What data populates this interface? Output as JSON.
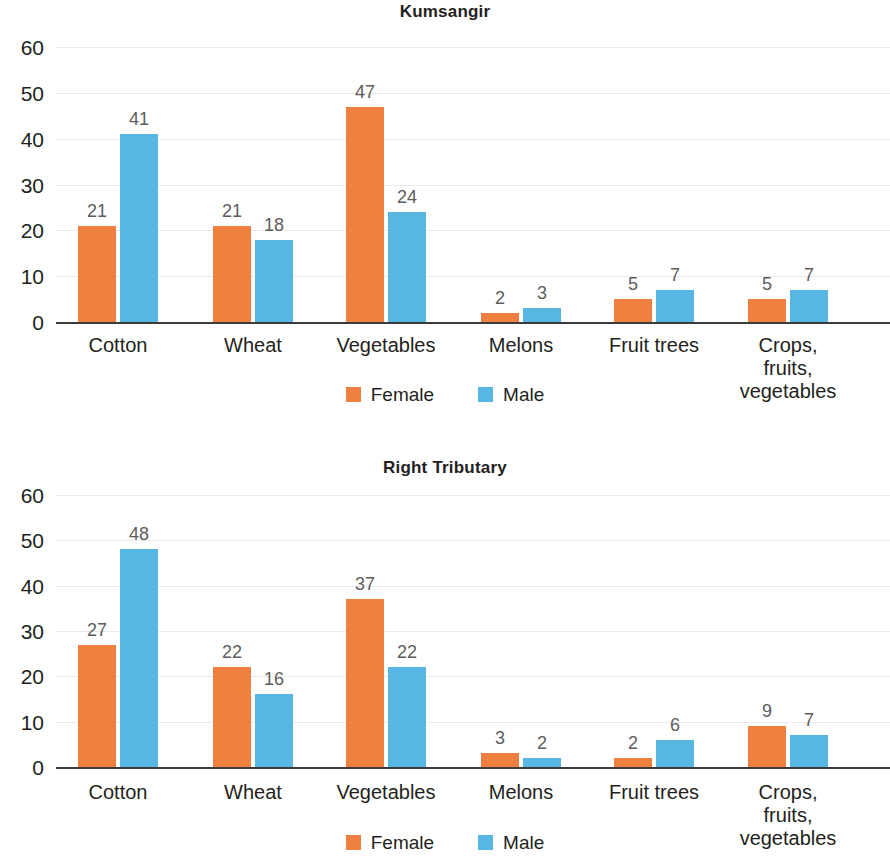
{
  "colors": {
    "female": "#f0803f",
    "male": "#57b7e2",
    "axis": "#3b3b3b",
    "grid": "#e9eaec",
    "text": "#231f20",
    "value_label": "#5d5d5d"
  },
  "legend": {
    "female_label": "Female",
    "male_label": "Male"
  },
  "chart_data": [
    {
      "type": "bar",
      "title": "Kumsangir",
      "xlabel": "",
      "ylabel": "",
      "ylim": [
        0,
        60
      ],
      "yticks": [
        0,
        10,
        20,
        30,
        40,
        50,
        60
      ],
      "ytick_labels": [
        "0",
        "10",
        "20",
        "30",
        "40",
        "50",
        "60"
      ],
      "grid": true,
      "legend_position": "bottom-center",
      "categories": [
        "Cotton",
        "Wheat",
        "Vegetables",
        "Melons",
        "Fruit trees",
        "Crops, fruits,\nvegetables"
      ],
      "series": [
        {
          "name": "Female",
          "color": "#f0803f",
          "values": [
            21,
            21,
            47,
            2,
            5,
            5
          ]
        },
        {
          "name": "Male",
          "color": "#57b7e2",
          "values": [
            41,
            18,
            24,
            3,
            7,
            7
          ]
        }
      ]
    },
    {
      "type": "bar",
      "title": "Right Tributary",
      "xlabel": "",
      "ylabel": "",
      "ylim": [
        0,
        60
      ],
      "yticks": [
        0,
        10,
        20,
        30,
        40,
        50,
        60
      ],
      "ytick_labels": [
        "0",
        "10",
        "20",
        "30",
        "40",
        "50",
        "60"
      ],
      "grid": true,
      "legend_position": "bottom-center",
      "categories": [
        "Cotton",
        "Wheat",
        "Vegetables",
        "Melons",
        "Fruit trees",
        "Crops, fruits,\nvegetables"
      ],
      "series": [
        {
          "name": "Female",
          "color": "#f0803f",
          "values": [
            27,
            22,
            37,
            3,
            2,
            9
          ]
        },
        {
          "name": "Male",
          "color": "#57b7e2",
          "values": [
            48,
            16,
            22,
            2,
            6,
            7
          ]
        }
      ]
    }
  ]
}
